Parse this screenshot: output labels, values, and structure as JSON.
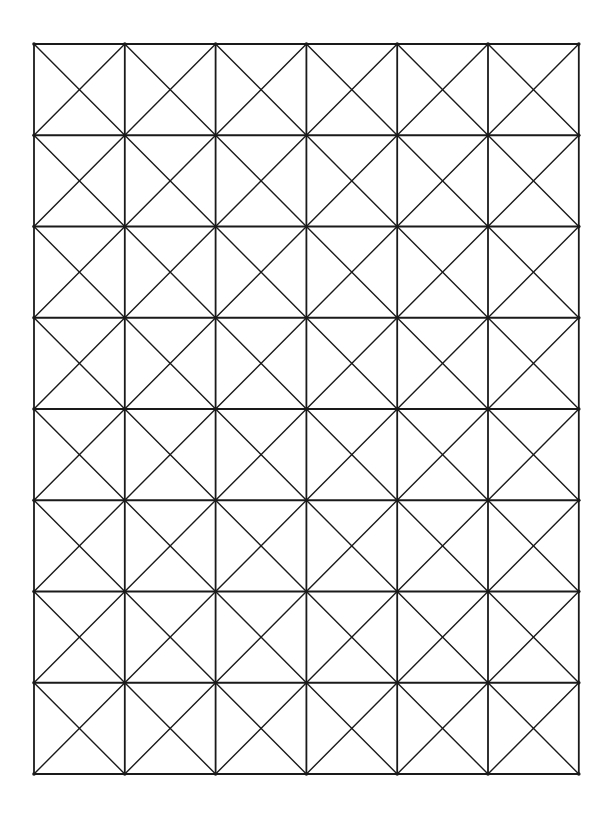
{
  "diagram": {
    "type": "square-grid-with-diagonals",
    "columns": 6,
    "rows": 8,
    "origin": {
      "x": 34,
      "y": 44
    },
    "cell_width": 90.8,
    "cell_height": 91.25,
    "diagonals": "both",
    "stroke_color": "#1a1a1a",
    "background_color": "#ffffff",
    "grid_stroke_width": 1.8,
    "diagonal_stroke_width": 1.4
  }
}
